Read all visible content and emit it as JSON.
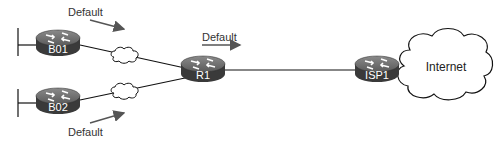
{
  "diagram": {
    "routers": [
      {
        "id": "B01",
        "label": "B01"
      },
      {
        "id": "B02",
        "label": "B02"
      },
      {
        "id": "R1",
        "label": "R1"
      },
      {
        "id": "ISP1",
        "label": "ISP1"
      }
    ],
    "cloud": {
      "label": "Internet"
    },
    "default_routes": [
      {
        "label": "Default",
        "from": "B01",
        "to": "R1"
      },
      {
        "label": "Default",
        "from": "B02",
        "to": "R1"
      },
      {
        "label": "Default",
        "from": "R1",
        "to": "ISP1"
      }
    ],
    "links": [
      {
        "from": "B01",
        "to": "R1",
        "type": "WAN"
      },
      {
        "from": "B02",
        "to": "R1",
        "type": "WAN"
      },
      {
        "from": "R1",
        "to": "ISP1",
        "type": "Ethernet"
      },
      {
        "from": "ISP1",
        "to": "Internet",
        "type": "connection"
      }
    ],
    "colors": {
      "router_top": "#6e6e6e",
      "router_side": "#3c3c3c",
      "arrow": "#555555",
      "line": "#111111"
    }
  }
}
